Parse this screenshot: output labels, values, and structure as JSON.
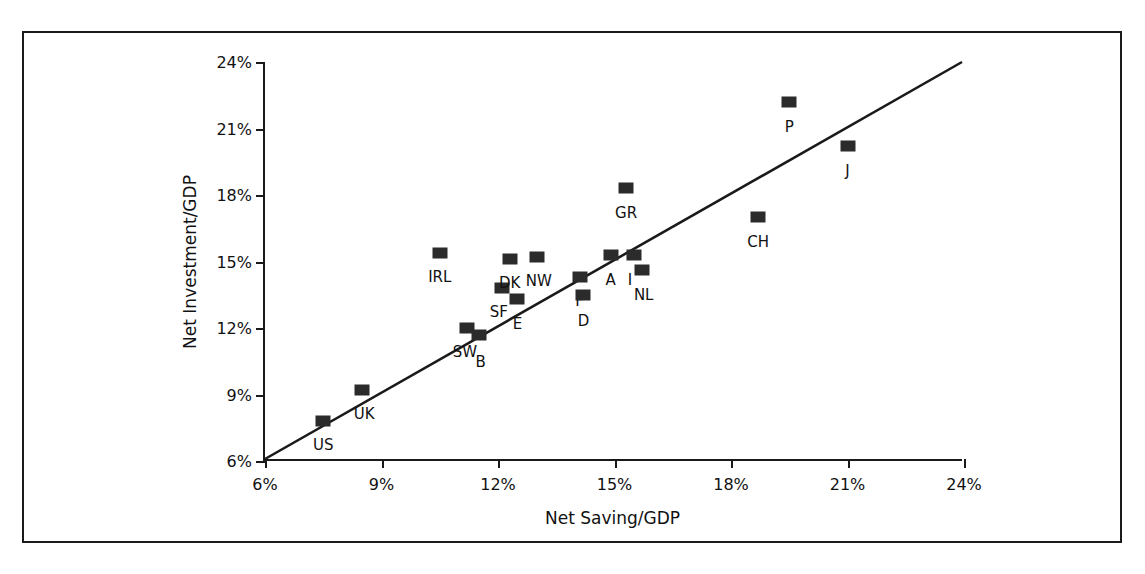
{
  "chart_data": {
    "type": "scatter",
    "title": "",
    "xlabel": "Net Saving/GDP",
    "ylabel": "Net Investment/GDP",
    "xlim": [
      6,
      24
    ],
    "ylim": [
      6,
      24
    ],
    "xticks": [
      "6%",
      "9%",
      "12%",
      "15%",
      "18%",
      "21%",
      "24%"
    ],
    "yticks": [
      "6%",
      "9%",
      "12%",
      "15%",
      "18%",
      "21%",
      "24%"
    ],
    "xtick_values": [
      6,
      9,
      12,
      15,
      18,
      21,
      24
    ],
    "ytick_values": [
      6,
      9,
      12,
      15,
      18,
      21,
      24
    ],
    "grid": false,
    "legend": false,
    "reference_line": {
      "label": "45-degree line",
      "from": [
        6,
        6
      ],
      "to": [
        24,
        24
      ]
    },
    "marker_color": "#2b2b2b",
    "axis_color": "#1a1a1a",
    "points": [
      {
        "label": "US",
        "x": 7.5,
        "y": 7.8,
        "lx": 0,
        "ly": 15
      },
      {
        "label": "UK",
        "x": 8.5,
        "y": 9.2,
        "lx": 2,
        "ly": 15
      },
      {
        "label": "IRL",
        "x": 10.5,
        "y": 15.4,
        "lx": 0,
        "ly": 15
      },
      {
        "label": "SW",
        "x": 11.2,
        "y": 12.0,
        "lx": -2,
        "ly": 15
      },
      {
        "label": "B",
        "x": 11.5,
        "y": 11.7,
        "lx": 2,
        "ly": 18
      },
      {
        "label": "SF",
        "x": 12.1,
        "y": 13.8,
        "lx": -3,
        "ly": 15
      },
      {
        "label": "DK",
        "x": 12.3,
        "y": 15.1,
        "lx": 0,
        "ly": 15
      },
      {
        "label": "E",
        "x": 12.5,
        "y": 13.3,
        "lx": 0,
        "ly": 16
      },
      {
        "label": "NW",
        "x": 13.0,
        "y": 15.2,
        "lx": 2,
        "ly": 15
      },
      {
        "label": "F",
        "x": 14.1,
        "y": 14.3,
        "lx": 0,
        "ly": 15
      },
      {
        "label": "D",
        "x": 14.2,
        "y": 13.5,
        "lx": 0,
        "ly": 17
      },
      {
        "label": "A",
        "x": 14.9,
        "y": 15.3,
        "lx": 0,
        "ly": 16
      },
      {
        "label": "I",
        "x": 15.5,
        "y": 15.3,
        "lx": -4,
        "ly": 16
      },
      {
        "label": "NL",
        "x": 15.7,
        "y": 14.6,
        "lx": 2,
        "ly": 16
      },
      {
        "label": "GR",
        "x": 15.3,
        "y": 18.3,
        "lx": 0,
        "ly": 16
      },
      {
        "label": "CH",
        "x": 18.7,
        "y": 17.0,
        "lx": 0,
        "ly": 16
      },
      {
        "label": "P",
        "x": 19.5,
        "y": 22.2,
        "lx": 0,
        "ly": 16
      },
      {
        "label": "J",
        "x": 21.0,
        "y": 20.2,
        "lx": 0,
        "ly": 16
      }
    ]
  }
}
